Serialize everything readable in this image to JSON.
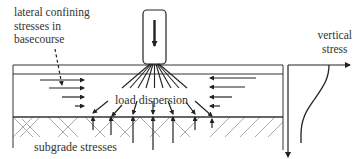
{
  "labels": {
    "lateral_line1": "lateral confining",
    "lateral_line2": "stresses in",
    "lateral_line3": "basecourse",
    "vertical_line1": "vertical",
    "vertical_line2": "stress",
    "load_dispersion": "load dispersion",
    "subgrade_stresses": "subgrade stresses"
  },
  "colors": {
    "line": "#222222",
    "hatch": "#999999",
    "text": "#333333"
  }
}
